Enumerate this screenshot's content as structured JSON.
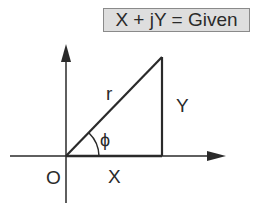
{
  "given_label": "X + jY = Given",
  "labels": {
    "hypotenuse": "r",
    "vertical_side": "Y",
    "angle": "ϕ",
    "origin": "O",
    "horizontal_side": "X"
  },
  "colors": {
    "line": "#2a2a2a",
    "box_fill": "#dedede",
    "box_border": "#8a8a8a"
  }
}
